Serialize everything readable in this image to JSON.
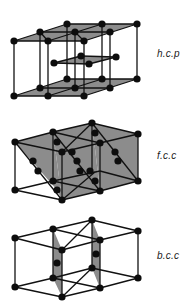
{
  "colors": {
    "background": "#ffffff",
    "line": "#111111",
    "atom": "#0d0d0d",
    "plane_fill": "#8c8c8c",
    "label": "#1a1a1a"
  },
  "structures": [
    {
      "id": "hcp",
      "label": "h.c.p",
      "label_pos": [
        157,
        48
      ],
      "planes": [
        [
          [
            14,
            41
          ],
          [
            67,
            24
          ],
          [
            137,
            24
          ],
          [
            84,
            41
          ]
        ],
        [
          [
            14,
            96
          ],
          [
            67,
            79
          ],
          [
            137,
            79
          ],
          [
            84,
            96
          ]
        ],
        [
          [
            54,
            63
          ],
          [
            81,
            56
          ],
          [
            116,
            57
          ],
          [
            89,
            64
          ]
        ]
      ],
      "edges": [
        [
          [
            14,
            41
          ],
          [
            67,
            24
          ]
        ],
        [
          [
            67,
            24
          ],
          [
            137,
            24
          ]
        ],
        [
          [
            137,
            24
          ],
          [
            84,
            41
          ]
        ],
        [
          [
            84,
            41
          ],
          [
            14,
            41
          ]
        ],
        [
          [
            40,
            32
          ],
          [
            110,
            32
          ]
        ],
        [
          [
            48,
            41
          ],
          [
            102,
            24
          ]
        ],
        [
          [
            40,
            32
          ],
          [
            48,
            41
          ]
        ],
        [
          [
            75,
            32
          ],
          [
            84,
            41
          ]
        ],
        [
          [
            14,
            96
          ],
          [
            67,
            79
          ]
        ],
        [
          [
            67,
            79
          ],
          [
            137,
            79
          ]
        ],
        [
          [
            137,
            79
          ],
          [
            84,
            96
          ]
        ],
        [
          [
            84,
            96
          ],
          [
            14,
            96
          ]
        ],
        [
          [
            40,
            88
          ],
          [
            110,
            88
          ]
        ],
        [
          [
            48,
            96
          ],
          [
            102,
            79
          ]
        ],
        [
          [
            14,
            41
          ],
          [
            14,
            96
          ]
        ],
        [
          [
            40,
            32
          ],
          [
            40,
            88
          ]
        ],
        [
          [
            48,
            41
          ],
          [
            48,
            96
          ]
        ],
        [
          [
            67,
            24
          ],
          [
            67,
            79
          ]
        ],
        [
          [
            75,
            32
          ],
          [
            75,
            88
          ]
        ],
        [
          [
            84,
            41
          ],
          [
            84,
            96
          ]
        ],
        [
          [
            102,
            24
          ],
          [
            102,
            79
          ]
        ],
        [
          [
            110,
            32
          ],
          [
            110,
            88
          ]
        ],
        [
          [
            137,
            24
          ],
          [
            137,
            79
          ]
        ],
        [
          [
            54,
            63
          ],
          [
            81,
            56
          ]
        ],
        [
          [
            81,
            56
          ],
          [
            116,
            57
          ]
        ],
        [
          [
            116,
            57
          ],
          [
            89,
            64
          ]
        ],
        [
          [
            89,
            64
          ],
          [
            54,
            63
          ]
        ]
      ],
      "atoms": [
        [
          67,
          24
        ],
        [
          102,
          24
        ],
        [
          137,
          24
        ],
        [
          40,
          32
        ],
        [
          75,
          32
        ],
        [
          110,
          32
        ],
        [
          14,
          41
        ],
        [
          48,
          41
        ],
        [
          84,
          41
        ],
        [
          54,
          63
        ],
        [
          81,
          56
        ],
        [
          116,
          57
        ],
        [
          89,
          64
        ],
        [
          67,
          79
        ],
        [
          102,
          79
        ],
        [
          137,
          79
        ],
        [
          40,
          88
        ],
        [
          75,
          88
        ],
        [
          110,
          88
        ],
        [
          14,
          96
        ],
        [
          48,
          96
        ],
        [
          84,
          96
        ]
      ]
    },
    {
      "id": "fcc",
      "label": "f.c.c",
      "label_pos": [
        157,
        150
      ],
      "planes": [
        [
          [
            15,
            142
          ],
          [
            53,
            132
          ],
          [
            62,
            200
          ],
          [
            57,
            190
          ]
        ],
        [
          [
            53,
            132
          ],
          [
            92,
            123
          ],
          [
            100,
            191
          ],
          [
            62,
            200
          ]
        ],
        [
          [
            92,
            123
          ],
          [
            138,
            134
          ],
          [
            138,
            181
          ],
          [
            100,
            191
          ]
        ]
      ],
      "edges": [
        [
          [
            15,
            142
          ],
          [
            53,
            132
          ]
        ],
        [
          [
            53,
            132
          ],
          [
            92,
            123
          ]
        ],
        [
          [
            92,
            123
          ],
          [
            138,
            134
          ]
        ],
        [
          [
            15,
            142
          ],
          [
            62,
            152
          ]
        ],
        [
          [
            62,
            152
          ],
          [
            100,
            143
          ]
        ],
        [
          [
            100,
            143
          ],
          [
            138,
            134
          ]
        ],
        [
          [
            53,
            132
          ],
          [
            100,
            143
          ]
        ],
        [
          [
            92,
            123
          ],
          [
            62,
            152
          ]
        ],
        [
          [
            15,
            190
          ],
          [
            53,
            181
          ]
        ],
        [
          [
            53,
            181
          ],
          [
            100,
            171
          ]
        ],
        [
          [
            100,
            171
          ],
          [
            138,
            181
          ]
        ],
        [
          [
            15,
            190
          ],
          [
            62,
            200
          ]
        ],
        [
          [
            62,
            200
          ],
          [
            100,
            191
          ]
        ],
        [
          [
            100,
            191
          ],
          [
            138,
            181
          ]
        ],
        [
          [
            53,
            181
          ],
          [
            100,
            191
          ]
        ],
        [
          [
            95,
            172
          ],
          [
            62,
            200
          ]
        ],
        [
          [
            15,
            142
          ],
          [
            15,
            190
          ]
        ],
        [
          [
            53,
            132
          ],
          [
            53,
            181
          ]
        ],
        [
          [
            62,
            152
          ],
          [
            62,
            200
          ]
        ],
        [
          [
            92,
            123
          ],
          [
            92,
            172
          ]
        ],
        [
          [
            100,
            143
          ],
          [
            100,
            191
          ]
        ],
        [
          [
            138,
            134
          ],
          [
            138,
            181
          ]
        ],
        [
          [
            15,
            142
          ],
          [
            62,
            200
          ]
        ],
        [
          [
            53,
            132
          ],
          [
            100,
            191
          ]
        ],
        [
          [
            92,
            123
          ],
          [
            138,
            181
          ]
        ]
      ],
      "atoms": [
        [
          15,
          142
        ],
        [
          53,
          132
        ],
        [
          92,
          123
        ],
        [
          138,
          134
        ],
        [
          62,
          152
        ],
        [
          100,
          143
        ],
        [
          57,
          142
        ],
        [
          72,
          152
        ],
        [
          95,
          133
        ],
        [
          115,
          152
        ],
        [
          33,
          161
        ],
        [
          38,
          171
        ],
        [
          77,
          161
        ],
        [
          80,
          171
        ],
        [
          90,
          171
        ],
        [
          95,
          181
        ],
        [
          118,
          161
        ],
        [
          15,
          190
        ],
        [
          53,
          181
        ],
        [
          62,
          200
        ],
        [
          100,
          191
        ],
        [
          138,
          181
        ],
        [
          57,
          190
        ]
      ]
    },
    {
      "id": "bcc",
      "label": "b.c.c",
      "label_pos": [
        157,
        250
      ],
      "planes": [
        [
          [
            53,
            229
          ],
          [
            62,
            250
          ],
          [
            62,
            297
          ],
          [
            53,
            278
          ]
        ],
        [
          [
            92,
            220
          ],
          [
            100,
            240
          ],
          [
            100,
            288
          ],
          [
            92,
            268
          ]
        ]
      ],
      "edges": [
        [
          [
            15,
            238
          ],
          [
            53,
            229
          ]
        ],
        [
          [
            53,
            229
          ],
          [
            92,
            220
          ]
        ],
        [
          [
            92,
            220
          ],
          [
            138,
            231
          ]
        ],
        [
          [
            15,
            238
          ],
          [
            62,
            250
          ]
        ],
        [
          [
            62,
            250
          ],
          [
            100,
            240
          ]
        ],
        [
          [
            100,
            240
          ],
          [
            138,
            231
          ]
        ],
        [
          [
            53,
            229
          ],
          [
            100,
            240
          ]
        ],
        [
          [
            92,
            220
          ],
          [
            62,
            250
          ]
        ],
        [
          [
            15,
            287
          ],
          [
            53,
            278
          ]
        ],
        [
          [
            53,
            278
          ],
          [
            92,
            268
          ]
        ],
        [
          [
            92,
            268
          ],
          [
            138,
            278
          ]
        ],
        [
          [
            15,
            287
          ],
          [
            62,
            297
          ]
        ],
        [
          [
            62,
            297
          ],
          [
            100,
            288
          ]
        ],
        [
          [
            100,
            288
          ],
          [
            138,
            278
          ]
        ],
        [
          [
            53,
            278
          ],
          [
            100,
            288
          ]
        ],
        [
          [
            92,
            268
          ],
          [
            62,
            297
          ]
        ],
        [
          [
            15,
            238
          ],
          [
            15,
            287
          ]
        ],
        [
          [
            53,
            229
          ],
          [
            53,
            278
          ]
        ],
        [
          [
            62,
            250
          ],
          [
            62,
            297
          ]
        ],
        [
          [
            92,
            220
          ],
          [
            92,
            268
          ]
        ],
        [
          [
            100,
            240
          ],
          [
            100,
            288
          ]
        ],
        [
          [
            138,
            231
          ],
          [
            138,
            278
          ]
        ]
      ],
      "atoms": [
        [
          15,
          238
        ],
        [
          53,
          229
        ],
        [
          92,
          220
        ],
        [
          138,
          231
        ],
        [
          62,
          250
        ],
        [
          100,
          240
        ],
        [
          57,
          263
        ],
        [
          96,
          254
        ],
        [
          15,
          287
        ],
        [
          53,
          278
        ],
        [
          92,
          268
        ],
        [
          138,
          278
        ],
        [
          62,
          297
        ],
        [
          100,
          288
        ]
      ]
    }
  ]
}
